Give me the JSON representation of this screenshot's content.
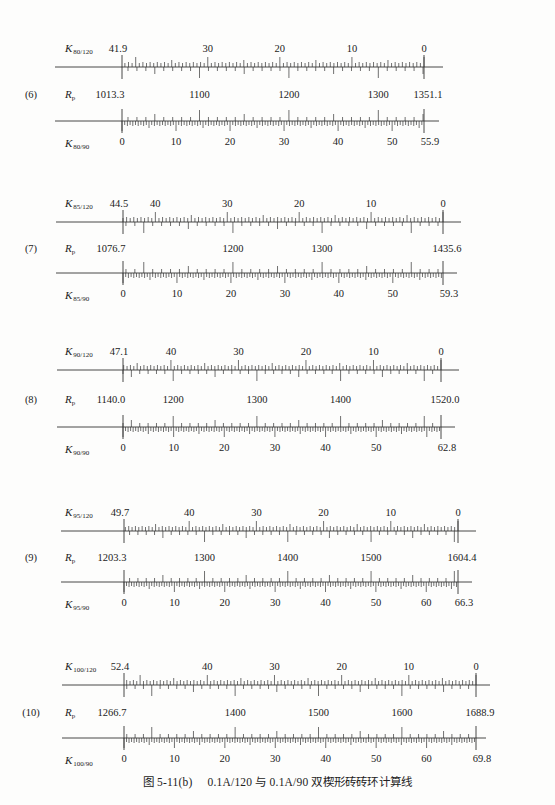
{
  "caption": {
    "figure_no": "图 5-11(b)",
    "title": "0.1A/120 与 0.1A/90 双楔形砖砖环计算线"
  },
  "chart_data": {
    "type": "nomogram",
    "title": "图 5-11(b) 0.1A/120 与 0.1A/90 双楔形砖砖环计算线",
    "middle_label": "Rp",
    "sections": [
      {
        "id": "(6)",
        "top_axis": {
          "name": "K",
          "sub": "80/120",
          "from": 41.9,
          "to": 0,
          "labels": [
            41.9,
            30,
            20,
            10,
            0
          ]
        },
        "rp": {
          "from": 1013.3,
          "to": 1351.1,
          "labels": [
            1013.3,
            1100,
            1200,
            1300,
            1351.1
          ]
        },
        "bottom_axis": {
          "name": "K",
          "sub": "80/90",
          "from": 0,
          "to": 55.9,
          "labels": [
            0,
            10,
            20,
            30,
            40,
            50,
            55.9
          ]
        },
        "geom": {
          "yTop": 67,
          "yBot": 121,
          "x0": 122,
          "x1": 424,
          "lineL": 55,
          "lineR": 443
        }
      },
      {
        "id": "(7)",
        "top_axis": {
          "name": "K",
          "sub": "85/120",
          "from": 44.5,
          "to": 0,
          "labels": [
            44.5,
            40,
            30,
            20,
            10,
            0
          ]
        },
        "rp": {
          "from": 1076.7,
          "to": 1435.6,
          "labels": [
            1076.7,
            1200,
            1300,
            1435.6
          ]
        },
        "bottom_axis": {
          "name": "K",
          "sub": "85/90",
          "from": 0,
          "to": 59.3,
          "labels": [
            0,
            10,
            20,
            30,
            40,
            50,
            59.3
          ]
        },
        "geom": {
          "yTop": 222,
          "yBot": 273,
          "x0": 123,
          "x1": 443,
          "lineL": 56,
          "lineR": 461
        }
      },
      {
        "id": "(8)",
        "top_axis": {
          "name": "K",
          "sub": "90/120",
          "from": 47.1,
          "to": 0,
          "labels": [
            47.1,
            40,
            30,
            20,
            10,
            0
          ]
        },
        "rp": {
          "from": 1140.0,
          "to": 1520.0,
          "labels": [
            "1140.0",
            1200,
            1300,
            1400,
            "1520.0"
          ]
        },
        "bottom_axis": {
          "name": "K",
          "sub": "90/90",
          "from": 0,
          "to": 62.8,
          "labels": [
            0,
            10,
            20,
            30,
            40,
            50,
            62.8
          ]
        },
        "geom": {
          "yTop": 370,
          "yBot": 427,
          "x0": 123,
          "x1": 441,
          "lineL": 57,
          "lineR": 459
        }
      },
      {
        "id": "(9)",
        "top_axis": {
          "name": "K",
          "sub": "95/120",
          "from": 49.7,
          "to": 0,
          "labels": [
            49.7,
            40,
            30,
            20,
            10,
            0
          ]
        },
        "rp": {
          "from": 1203.3,
          "to": 1604.4,
          "labels": [
            1203.3,
            1300,
            1400,
            1500,
            1604.4
          ]
        },
        "bottom_axis": {
          "name": "K",
          "sub": "95/90",
          "from": 0,
          "to": 66.3,
          "labels": [
            0,
            10,
            20,
            30,
            40,
            50,
            60,
            66.3
          ]
        },
        "geom": {
          "yTop": 531,
          "yBot": 582,
          "x0": 124,
          "x1": 458,
          "lineL": 61,
          "lineR": 476
        }
      },
      {
        "id": "(10)",
        "top_axis": {
          "name": "K",
          "sub": "100/120",
          "from": 52.4,
          "to": 0,
          "labels": [
            52.4,
            40,
            30,
            20,
            10,
            0
          ]
        },
        "rp": {
          "from": 1266.7,
          "to": 1688.9,
          "labels": [
            1266.7,
            1400,
            1500,
            1600,
            1688.9
          ]
        },
        "bottom_axis": {
          "name": "K",
          "sub": "100/90",
          "from": 0,
          "to": 69.8,
          "labels": [
            0,
            10,
            20,
            30,
            40,
            50,
            60,
            69.8
          ]
        },
        "geom": {
          "yTop": 685,
          "yBot": 738,
          "x0": 124,
          "x1": 476,
          "lineL": 62,
          "lineR": 490
        }
      }
    ]
  }
}
